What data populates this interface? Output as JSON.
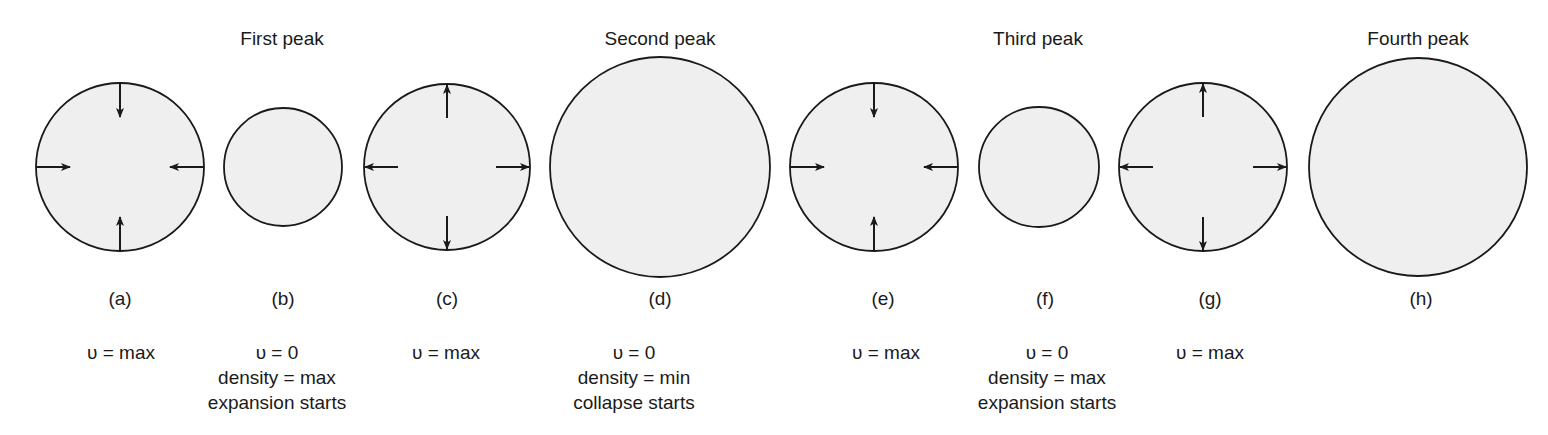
{
  "figure": {
    "fill_color": "#efefef",
    "stroke_color": "#1a1a1a",
    "peak_titles": [
      {
        "label": "First peak",
        "x": 282
      },
      {
        "label": "Second peak",
        "x": 660
      },
      {
        "label": "Third peak",
        "x": 1038
      },
      {
        "label": "Fourth peak",
        "x": 1418
      }
    ],
    "panels": [
      {
        "id": "a",
        "label": "(a)",
        "x": 120,
        "radius": 84,
        "arrows": "inward",
        "lines": [
          "υ = max"
        ]
      },
      {
        "id": "b",
        "label": "(b)",
        "x": 283,
        "radius": 59,
        "arrows": "none",
        "lines": [
          "υ = 0",
          "density = max",
          "expansion starts"
        ]
      },
      {
        "id": "c",
        "label": "(c)",
        "x": 447,
        "radius": 83,
        "arrows": "outward",
        "lines": [
          "υ = max"
        ]
      },
      {
        "id": "d",
        "label": "(d)",
        "x": 660,
        "radius": 110,
        "arrows": "none",
        "lines": [
          "υ = 0",
          "density = min",
          "collapse starts"
        ]
      },
      {
        "id": "e",
        "label": "(e)",
        "x": 874,
        "radius": 84,
        "arrows": "inward",
        "lines": [
          "υ = max"
        ]
      },
      {
        "id": "f",
        "label": "(f)",
        "x": 1039,
        "radius": 60,
        "arrows": "none",
        "lines": [
          "υ = 0",
          "density = max",
          "expansion starts"
        ]
      },
      {
        "id": "g",
        "label": "(g)",
        "x": 1203,
        "radius": 84,
        "arrows": "outward",
        "lines": [
          "υ = max"
        ]
      },
      {
        "id": "h",
        "label": "(h)",
        "x": 1418,
        "radius": 109,
        "arrows": "none",
        "lines": []
      }
    ]
  }
}
